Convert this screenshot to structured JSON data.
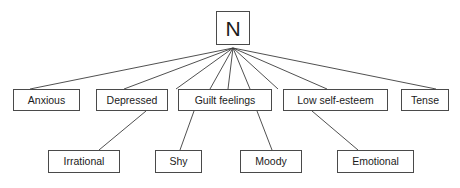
{
  "diagram": {
    "type": "hierarchy-tree",
    "title": "N",
    "background_color": "#ffffff",
    "box_border_color": "#4a4a4a",
    "edge_color": "#3c3c3c",
    "text_color": "#1b1b1b",
    "root": {
      "id": "root-n",
      "label": "N",
      "x": 216,
      "y": 11,
      "width": 34,
      "height": 34
    },
    "level1": [
      {
        "id": "anxious",
        "label": "Anxious",
        "x": 13,
        "y": 89,
        "width": 67,
        "height": 22
      },
      {
        "id": "depressed",
        "label": "Depressed",
        "x": 96,
        "y": 89,
        "width": 72,
        "height": 22
      },
      {
        "id": "guilt-feelings",
        "label": "Guilt feelings",
        "x": 178,
        "y": 89,
        "width": 94,
        "height": 22
      },
      {
        "id": "low-self-esteem",
        "label": "Low self-esteem",
        "x": 283,
        "y": 89,
        "width": 105,
        "height": 22
      },
      {
        "id": "tense",
        "label": "Tense",
        "x": 401,
        "y": 89,
        "width": 48,
        "height": 22
      }
    ],
    "level2": [
      {
        "id": "irrational",
        "label": "Irrational",
        "x": 48,
        "y": 150,
        "width": 72,
        "height": 23
      },
      {
        "id": "shy",
        "label": "Shy",
        "x": 155,
        "y": 150,
        "width": 47,
        "height": 23
      },
      {
        "id": "moody",
        "label": "Moody",
        "x": 240,
        "y": 150,
        "width": 62,
        "height": 23
      },
      {
        "id": "emotional",
        "label": "Emotional",
        "x": 337,
        "y": 150,
        "width": 77,
        "height": 23
      }
    ],
    "edges": [
      {
        "id": "edge-n-anxious",
        "from": "root-n",
        "to": "anxious",
        "x1": 233,
        "y1": 48,
        "x2": 30,
        "y2": 89
      },
      {
        "id": "edge-n-depressed",
        "from": "root-n",
        "to": "depressed",
        "x1": 233,
        "y1": 48,
        "x2": 124,
        "y2": 89
      },
      {
        "id": "edge-n-guilt-left",
        "from": "root-n",
        "to": "guilt-feelings",
        "x1": 233,
        "y1": 48,
        "x2": 176,
        "y2": 89
      },
      {
        "id": "edge-n-guilt-mid-left",
        "from": "root-n",
        "to": "guilt-feelings",
        "x1": 233,
        "y1": 48,
        "x2": 210,
        "y2": 89
      },
      {
        "id": "edge-n-guilt-mid",
        "from": "root-n",
        "to": "guilt-feelings",
        "x1": 233,
        "y1": 48,
        "x2": 228,
        "y2": 89
      },
      {
        "id": "edge-n-guilt-mid-right",
        "from": "root-n",
        "to": "guilt-feelings",
        "x1": 233,
        "y1": 48,
        "x2": 250,
        "y2": 89
      },
      {
        "id": "edge-n-low-self-left",
        "from": "root-n",
        "to": "low-self-esteem",
        "x1": 233,
        "y1": 48,
        "x2": 278,
        "y2": 89
      },
      {
        "id": "edge-n-low-self-esteem",
        "from": "root-n",
        "to": "low-self-esteem",
        "x1": 233,
        "y1": 48,
        "x2": 327,
        "y2": 89
      },
      {
        "id": "edge-n-tense",
        "from": "root-n",
        "to": "tense",
        "x1": 233,
        "y1": 48,
        "x2": 436,
        "y2": 89
      },
      {
        "id": "edge-depressed-irrational",
        "from": "depressed",
        "to": "irrational",
        "x1": 146,
        "y1": 111,
        "x2": 99,
        "y2": 150
      },
      {
        "id": "edge-guilt-shy",
        "from": "guilt-feelings",
        "to": "shy",
        "x1": 194,
        "y1": 111,
        "x2": 180,
        "y2": 150
      },
      {
        "id": "edge-guilt-moody",
        "from": "guilt-feelings",
        "to": "moody",
        "x1": 257,
        "y1": 111,
        "x2": 272,
        "y2": 150
      },
      {
        "id": "edge-low-self-emotional",
        "from": "low-self-esteem",
        "to": "emotional",
        "x1": 312,
        "y1": 111,
        "x2": 358,
        "y2": 150
      }
    ]
  }
}
